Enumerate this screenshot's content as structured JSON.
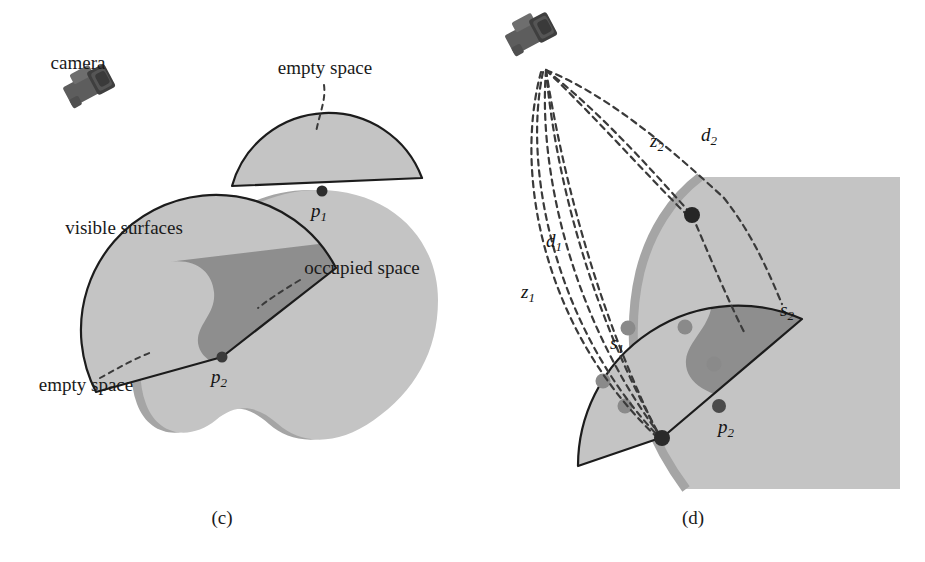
{
  "figure": {
    "panels": [
      {
        "id": "c",
        "caption": "(c)",
        "caption_pos": {
          "x": 222,
          "y": 524
        },
        "labels": [
          {
            "key": "camera",
            "text": "camera",
            "x": 78,
            "y": 69,
            "anchor": "middle"
          },
          {
            "key": "empty_space_top",
            "text": "empty space",
            "x": 325,
            "y": 74,
            "anchor": "middle"
          },
          {
            "key": "visible_surfaces",
            "text": "visible surfaces",
            "x": 124,
            "y": 234,
            "anchor": "middle"
          },
          {
            "key": "occupied_space",
            "text": "occupied space",
            "x": 362,
            "y": 274,
            "anchor": "middle"
          },
          {
            "key": "empty_space_bottom",
            "text": "empty space",
            "x": 86,
            "y": 391,
            "anchor": "middle"
          }
        ],
        "points": [
          {
            "key": "p1",
            "label": "p",
            "sub": "1",
            "x": 322,
            "y": 191,
            "label_x": 318,
            "label_y": 216
          },
          {
            "key": "p2",
            "label": "p",
            "sub": "2",
            "x": 222,
            "y": 357,
            "label_x": 218,
            "label_y": 382
          }
        ]
      },
      {
        "id": "d",
        "caption": "(d)",
        "caption_pos": {
          "x": 693,
          "y": 524
        },
        "labels": [
          {
            "key": "z1",
            "text": "z",
            "sub": "1",
            "x": 528,
            "y": 297,
            "italic": true
          },
          {
            "key": "d1",
            "text": "d",
            "sub": "1",
            "x": 553,
            "y": 246,
            "italic": true
          },
          {
            "key": "z2",
            "text": "z",
            "sub": "2",
            "x": 657,
            "y": 146,
            "italic": true
          },
          {
            "key": "d2",
            "text": "d",
            "sub": "2",
            "x": 708,
            "y": 140,
            "italic": true
          },
          {
            "key": "s1",
            "text": "s",
            "sub": "1",
            "x": 616,
            "y": 348,
            "italic": true
          },
          {
            "key": "s2",
            "text": "s",
            "sub": "2",
            "x": 787,
            "y": 315,
            "italic": true
          }
        ],
        "points": [
          {
            "key": "p1d",
            "label": "",
            "sub": "",
            "x": 692,
            "y": 215
          },
          {
            "key": "p2d",
            "label": "p",
            "sub": "2",
            "x": 719,
            "y": 406,
            "label_x": 727,
            "label_y": 432
          },
          {
            "key": "origin_hit",
            "label": "",
            "sub": "",
            "x": 663,
            "y": 437
          }
        ],
        "voxels": [
          {
            "x": 628,
            "y": 328,
            "r": 7
          },
          {
            "x": 685,
            "y": 327,
            "r": 7
          },
          {
            "x": 714,
            "y": 364,
            "r": 7
          },
          {
            "x": 603,
            "y": 381,
            "r": 7
          },
          {
            "x": 625,
            "y": 406,
            "r": 7
          }
        ],
        "camera_origin": {
          "x": 546,
          "y": 68
        }
      }
    ],
    "icons": [
      {
        "key": "camera-c",
        "name": "camera-icon",
        "x": 83,
        "y": 103,
        "rotation": -28
      },
      {
        "key": "camera-d",
        "name": "camera-icon",
        "x": 523,
        "y": 48,
        "rotation": -28
      }
    ],
    "colors": {
      "background": "#ffffff",
      "empty_space_fill": "#c3c3c3",
      "object_fill": "#c3c3c3",
      "occupied_fill": "#8f8f8f",
      "visible_surface_band": "#a8a8a8",
      "outline": "#1c1c1c",
      "dashed_ray": "#3a3a3a",
      "camera_body": "#5a5a5a",
      "camera_dark": "#3c3c3c",
      "point_dark": "#2a2a2a",
      "voxel_fill": "#8a8a8a",
      "panel_d_square": "#c3c3c3",
      "text": "#1a1a1a"
    }
  }
}
